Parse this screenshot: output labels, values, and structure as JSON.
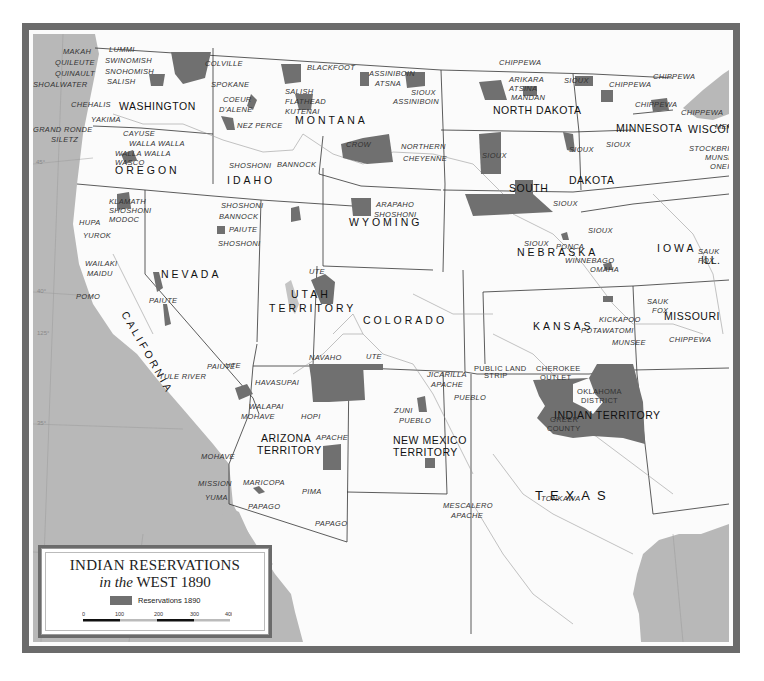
{
  "map": {
    "title": "INDIAN RESERVATIONS",
    "subtitle_italic": "in the",
    "subtitle_rest": "WEST 1890",
    "colors": {
      "reservation": "#707070",
      "water": "#b8b8b8",
      "land": "#fbfbfb",
      "frame": "#6b6b6b",
      "border": "#333333"
    },
    "legend": {
      "key_label": "Reservations 1890",
      "scale_ticks": [
        "0",
        "100",
        "200",
        "300",
        "400"
      ]
    },
    "states": {
      "washington": "WASHINGTON",
      "oregon": "OREGON",
      "california": "CALIFORNIA",
      "idaho": "IDAHO",
      "nevada": "NEVADA",
      "montana": "MONTANA",
      "wyoming": "WYOMING",
      "utah_1": "UTAH",
      "utah_2": "TERRITORY",
      "colorado": "COLORADO",
      "arizona_1": "ARIZONA",
      "arizona_2": "TERRITORY",
      "newmexico_1": "NEW MEXICO",
      "newmexico_2": "TERRITORY",
      "north_dakota": "NORTH DAKOTA",
      "south_1": "SOUTH",
      "south_2": "DAKOTA",
      "nebraska": "NEBRASKA",
      "kansas": "KANSAS",
      "texas": "TEXAS",
      "minnesota": "MINNESOTA",
      "wisconsin": "WISCONSIN",
      "iowa": "IOWA",
      "illinois": "ILL.",
      "missouri": "MISSOURI",
      "indian_territory": "INDIAN TERRITORY",
      "public_land_1": "PUBLIC LAND",
      "public_land_2": "STRIP",
      "cherokee_1": "CHEROKEE",
      "cherokee_2": "OUTLET",
      "oklahoma_1": "OKLAHOMA",
      "oklahoma_2": "DISTRICT",
      "greer_1": "GREER",
      "greer_2": "COUNTY"
    },
    "reservations": [
      {
        "label": "MAKAH",
        "x": 30,
        "y": 20
      },
      {
        "label": "QUILEUTE",
        "x": 22,
        "y": 31
      },
      {
        "label": "QUINAULT",
        "x": 22,
        "y": 42
      },
      {
        "label": "SHOALWATER",
        "x": 0,
        "y": 53
      },
      {
        "label": "LUMMI",
        "x": 76,
        "y": 18
      },
      {
        "label": "SWINOMISH",
        "x": 72,
        "y": 29
      },
      {
        "label": "SNOHOMISH",
        "x": 72,
        "y": 40
      },
      {
        "label": "SALISH",
        "x": 74,
        "y": 50
      },
      {
        "label": "CHEHALIS",
        "x": 38,
        "y": 73
      },
      {
        "label": "YAKIMA",
        "x": 58,
        "y": 88
      },
      {
        "label": "GRAND RONDE",
        "x": 0,
        "y": 98
      },
      {
        "label": "SILETZ",
        "x": 18,
        "y": 108
      },
      {
        "label": "CAYUSE",
        "x": 90,
        "y": 102
      },
      {
        "label": "WALLA WALLA",
        "x": 96,
        "y": 112
      },
      {
        "label": "WALLA WALLA",
        "x": 82,
        "y": 122
      },
      {
        "label": "WASCO",
        "x": 82,
        "y": 131
      },
      {
        "label": "COLVILLE",
        "x": 172,
        "y": 32
      },
      {
        "label": "SPOKANE",
        "x": 178,
        "y": 53
      },
      {
        "label": "COEUR",
        "x": 190,
        "y": 68
      },
      {
        "label": "D'ALENE",
        "x": 186,
        "y": 78
      },
      {
        "label": "NEZ PERCE",
        "x": 204,
        "y": 94
      },
      {
        "label": "BLACKFOOT",
        "x": 274,
        "y": 36
      },
      {
        "label": "SALISH",
        "x": 252,
        "y": 60
      },
      {
        "label": "FLATHEAD",
        "x": 252,
        "y": 70
      },
      {
        "label": "KUTENAI",
        "x": 252,
        "y": 80
      },
      {
        "label": "ASSINIBOIN",
        "x": 336,
        "y": 42
      },
      {
        "label": "ATSNA",
        "x": 342,
        "y": 52
      },
      {
        "label": "SIOUX",
        "x": 378,
        "y": 61
      },
      {
        "label": "ASSINIBOIN",
        "x": 360,
        "y": 70
      },
      {
        "label": "CROW",
        "x": 313,
        "y": 113
      },
      {
        "label": "NORTHERN",
        "x": 368,
        "y": 115
      },
      {
        "label": "CHEYENNE",
        "x": 370,
        "y": 127
      },
      {
        "label": "SHOSHONI",
        "x": 196,
        "y": 134
      },
      {
        "label": "BANNOCK",
        "x": 244,
        "y": 133
      },
      {
        "label": "KLAMATH",
        "x": 76,
        "y": 170
      },
      {
        "label": "SHOSHONI",
        "x": 76,
        "y": 179
      },
      {
        "label": "MODOC",
        "x": 76,
        "y": 188
      },
      {
        "label": "SHOSHONI",
        "x": 188,
        "y": 174
      },
      {
        "label": "BANNOCK",
        "x": 186,
        "y": 185
      },
      {
        "label": "PAIUTE",
        "x": 196,
        "y": 198
      },
      {
        "label": "SHOSHONI",
        "x": 185,
        "y": 212
      },
      {
        "label": "HUPA",
        "x": 46,
        "y": 191
      },
      {
        "label": "YUROK",
        "x": 50,
        "y": 204
      },
      {
        "label": "WAILAKI",
        "x": 52,
        "y": 232
      },
      {
        "label": "MAIDU",
        "x": 54,
        "y": 242
      },
      {
        "label": "POMO",
        "x": 43,
        "y": 265
      },
      {
        "label": "PAIUTE",
        "x": 116,
        "y": 269
      },
      {
        "label": "ARAPAHO",
        "x": 343,
        "y": 173
      },
      {
        "label": "SHOSHONI",
        "x": 341,
        "y": 183
      },
      {
        "label": "UTE",
        "x": 276,
        "y": 240
      },
      {
        "label": "NAVAHO",
        "x": 276,
        "y": 326
      },
      {
        "label": "UTE",
        "x": 333,
        "y": 325
      },
      {
        "label": "UTE",
        "x": 192,
        "y": 334
      },
      {
        "label": "PAIUTE",
        "x": 174,
        "y": 335
      },
      {
        "label": "TULE RIVER",
        "x": 126,
        "y": 345
      },
      {
        "label": "HAVASUPAI",
        "x": 222,
        "y": 351
      },
      {
        "label": "WALAPAI",
        "x": 216,
        "y": 375
      },
      {
        "label": "MOHAVE",
        "x": 208,
        "y": 385
      },
      {
        "label": "HOPI",
        "x": 268,
        "y": 385
      },
      {
        "label": "JICARILLA",
        "x": 394,
        "y": 343
      },
      {
        "label": "APACHE",
        "x": 398,
        "y": 353
      },
      {
        "label": "PUEBLO",
        "x": 421,
        "y": 366
      },
      {
        "label": "ZUNI",
        "x": 361,
        "y": 379
      },
      {
        "label": "PUEBLO",
        "x": 366,
        "y": 389
      },
      {
        "label": "APACHE",
        "x": 283,
        "y": 406
      },
      {
        "label": "MOHAVE",
        "x": 168,
        "y": 425
      },
      {
        "label": "MISSION",
        "x": 165,
        "y": 452
      },
      {
        "label": "MARICOPA",
        "x": 210,
        "y": 451
      },
      {
        "label": "PIMA",
        "x": 269,
        "y": 460
      },
      {
        "label": "YUMA",
        "x": 172,
        "y": 466
      },
      {
        "label": "PAPAGO",
        "x": 215,
        "y": 475
      },
      {
        "label": "PAPAGO",
        "x": 282,
        "y": 492
      },
      {
        "label": "MESCALERO",
        "x": 410,
        "y": 474
      },
      {
        "label": "APACHE",
        "x": 418,
        "y": 484
      },
      {
        "label": "CHIPPEWA",
        "x": 466,
        "y": 31
      },
      {
        "label": "ARIKARA",
        "x": 476,
        "y": 48
      },
      {
        "label": "ATSINA",
        "x": 476,
        "y": 57
      },
      {
        "label": "MANDAN",
        "x": 478,
        "y": 66
      },
      {
        "label": "SIOUX",
        "x": 531,
        "y": 49
      },
      {
        "label": "CHIPPEWA",
        "x": 576,
        "y": 53
      },
      {
        "label": "CHIPPEWA",
        "x": 620,
        "y": 45
      },
      {
        "label": "CHIPPEWA",
        "x": 602,
        "y": 73
      },
      {
        "label": "CHIPPEWA",
        "x": 648,
        "y": 81
      },
      {
        "label": "MENOMINI",
        "x": 682,
        "y": 95
      },
      {
        "label": "STOCKBRIDGE",
        "x": 656,
        "y": 117
      },
      {
        "label": "MUNSEE",
        "x": 672,
        "y": 126
      },
      {
        "label": "ONEIDA",
        "x": 677,
        "y": 135
      },
      {
        "label": "SIOUX",
        "x": 449,
        "y": 124
      },
      {
        "label": "SIOUX",
        "x": 536,
        "y": 118
      },
      {
        "label": "SIOUX",
        "x": 573,
        "y": 113
      },
      {
        "label": "SIOUX",
        "x": 520,
        "y": 172
      },
      {
        "label": "SIOUX",
        "x": 555,
        "y": 199
      },
      {
        "label": "SIOUX",
        "x": 491,
        "y": 212
      },
      {
        "label": "PONCA",
        "x": 523,
        "y": 215
      },
      {
        "label": "WINNEBAGO",
        "x": 532,
        "y": 229
      },
      {
        "label": "OMAHA",
        "x": 557,
        "y": 238
      },
      {
        "label": "SAUK",
        "x": 665,
        "y": 220
      },
      {
        "label": "FOX",
        "x": 665,
        "y": 229
      },
      {
        "label": "SAUK",
        "x": 614,
        "y": 270
      },
      {
        "label": "FOX",
        "x": 619,
        "y": 279
      },
      {
        "label": "KICKAPOO",
        "x": 566,
        "y": 288
      },
      {
        "label": "POTAWATOMI",
        "x": 548,
        "y": 299
      },
      {
        "label": "MUNSEE",
        "x": 579,
        "y": 311
      },
      {
        "label": "CHIPPEWA",
        "x": 636,
        "y": 308
      },
      {
        "label": "TONKAWA",
        "x": 508,
        "y": 467
      }
    ],
    "grid_labels": [
      {
        "label": "45°",
        "x": 3,
        "y": 130
      },
      {
        "label": "40°",
        "x": 4,
        "y": 259
      },
      {
        "label": "125°",
        "x": 4,
        "y": 301
      },
      {
        "label": "35°",
        "x": 4,
        "y": 391
      },
      {
        "label": "30°",
        "x": 5,
        "y": 518
      },
      {
        "label": "120°",
        "x": 84,
        "y": 543
      },
      {
        "label": "110°",
        "x": 320,
        "y": 645
      },
      {
        "label": "95°",
        "x": 657,
        "y": 645
      }
    ]
  }
}
